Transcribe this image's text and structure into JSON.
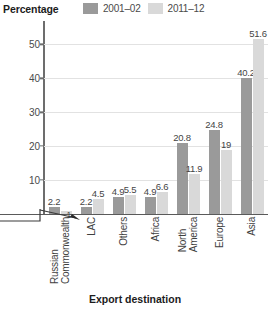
{
  "chart_data": {
    "type": "bar",
    "title": "",
    "xlabel": "Export destination",
    "ylabel": "Percentage",
    "categories": [
      "Russian Commonwealth",
      "LAC",
      "Others",
      "Africa",
      "North America",
      "Europe",
      "Asia"
    ],
    "category_lines": [
      [
        "Russian",
        "Commonwealth"
      ],
      [
        "LAC"
      ],
      [
        "Others"
      ],
      [
        "Africa"
      ],
      [
        "North",
        "America"
      ],
      [
        "Europe"
      ],
      [
        "Asia"
      ]
    ],
    "series": [
      {
        "name": "2001–02",
        "color": "#9a9a9a",
        "values": [
          2.2,
          2.2,
          4.9,
          4.9,
          20.8,
          24.8,
          40.2
        ]
      },
      {
        "name": "2011–12",
        "color": "#d9d9d9",
        "values": [
          1,
          4.5,
          5.5,
          6.6,
          11.9,
          19,
          51.6
        ]
      }
    ],
    "value_labels": [
      [
        "2.2",
        "1"
      ],
      [
        "2.2",
        "4.5"
      ],
      [
        "4.9",
        "5.5"
      ],
      [
        "4.9",
        "6.6"
      ],
      [
        "20.8",
        "11.9"
      ],
      [
        "24.8",
        "19"
      ],
      [
        "40.2",
        "51.6"
      ]
    ],
    "yticks": [
      10,
      20,
      30,
      40,
      50
    ],
    "ytick_labels": [
      "10",
      "20",
      "30",
      "40",
      "50"
    ],
    "ylim": [
      0,
      56
    ],
    "grid": true,
    "legend_position": "top"
  },
  "legend": {
    "items": [
      {
        "label": "2001–02",
        "color": "#9a9a9a"
      },
      {
        "label": "2011–12",
        "color": "#d9d9d9"
      }
    ]
  },
  "axes": {
    "y_title": "Percentage",
    "x_title": "Export destination"
  }
}
